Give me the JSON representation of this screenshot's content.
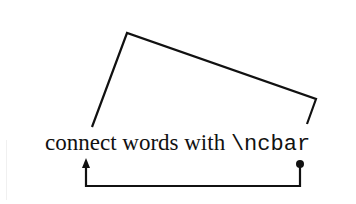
{
  "diagram": {
    "caption_plain": "connect words with ",
    "caption_command": "\\ncbar",
    "line_color": "#111111",
    "background": "#ffffff",
    "top_connector": {
      "type": "angled-bar",
      "description": "angled bar connecting 'connect' to '\\ncbar' from above",
      "points": [
        [
          92,
          127
        ],
        [
          127,
          33
        ],
        [
          316,
          99
        ],
        [
          307,
          124
        ]
      ]
    },
    "bottom_connector": {
      "type": "bar-with-arrow",
      "description": "rectangular bar from '\\ncbar' (dot end) back to 'connect' (arrow end)",
      "points": [
        [
          300,
          164
        ],
        [
          300,
          186
        ],
        [
          86,
          186
        ],
        [
          86,
          160
        ]
      ],
      "start_marker": "dot",
      "end_marker": "arrow"
    }
  }
}
